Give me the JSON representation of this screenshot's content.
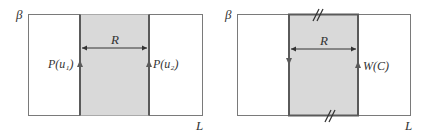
{
  "colors": {
    "frame": "#7a7a7a",
    "strip_fill": "#d9d9d9",
    "strip_border": "#5a5a5a",
    "text": "#333333"
  },
  "left_panel": {
    "y_axis_label": "β",
    "x_axis_label": "L",
    "width_label": "R",
    "left_line_label": "P(u₁)",
    "right_line_label": "P(u₂)",
    "left_line_direction": "up",
    "right_line_direction": "up"
  },
  "right_panel": {
    "y_axis_label": "β",
    "x_axis_label": "L",
    "width_label": "R",
    "loop_label": "W(C)",
    "left_line_direction": "down",
    "right_line_direction": "up",
    "top_mark": "//",
    "bottom_mark": "//"
  }
}
